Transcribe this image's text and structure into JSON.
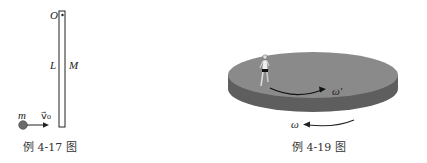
{
  "figures": [
    {
      "id": "fig-4-17",
      "caption": "例 4-17 图",
      "labels": {
        "pivot": "O",
        "length": "L",
        "mass_rod": "M",
        "mass_ball": "m",
        "velocity": "v⃗₀"
      }
    },
    {
      "id": "fig-4-19",
      "caption": "例 4-19 图",
      "labels": {
        "omega_prime": "ω′",
        "omega": "ω"
      }
    }
  ],
  "colors": {
    "disk_top": "#8a8a8a",
    "disk_side": "#5e5e5e",
    "ball": "#6b6b6b",
    "line": "#222222"
  }
}
